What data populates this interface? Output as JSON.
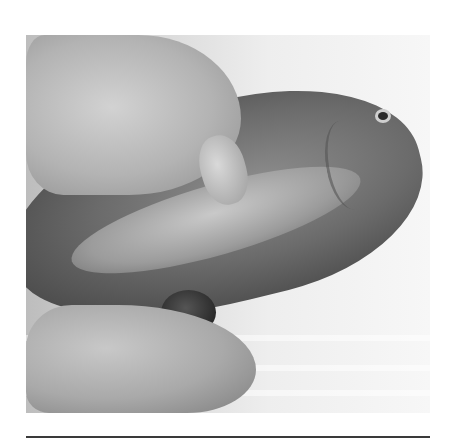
{
  "image": {
    "subject": "hands holding a fish, gutting",
    "colors": {
      "background": "#ffffff",
      "photo_light": "#f7f7f7",
      "photo_dark": "#4a4a4a",
      "rule": "#3a3a3a"
    }
  }
}
